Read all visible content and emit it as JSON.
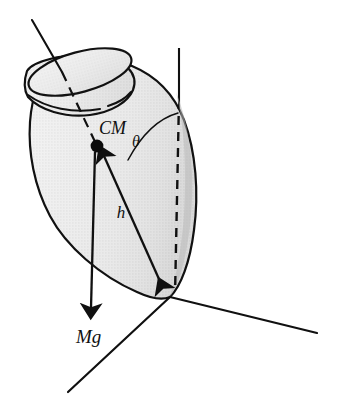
{
  "figure": {
    "name": "spinning-top-torque-diagram",
    "type": "physics-diagram",
    "background_color": "#ffffff",
    "width": 337,
    "height": 420
  },
  "labels": {
    "center_of_mass": "CM",
    "lever_arm": "h",
    "weight_force": "Mg",
    "tilt_angle": "θ"
  },
  "colors": {
    "ink": "#101010",
    "body_fill_light": "#ececec",
    "body_fill_mid": "#e2e2e2",
    "body_fill_shadow": "#c9c9c9",
    "rim_fill": "#e4e4e4",
    "outline": "#111111"
  },
  "elements": {
    "top_body": {
      "name": "spinning-top-body",
      "description": "Tear-drop / pear shaped top with a cylindrical neck, shaded with halftone gray"
    },
    "neck_rim": {
      "name": "top-neck-rim",
      "description": "Open elliptical rim at the top of the neck"
    },
    "neck_groove": {
      "name": "top-neck-groove",
      "description": "Curved groove line wrapping the neck below the rim"
    },
    "spin_axis": {
      "name": "spin-axis-line",
      "description": "Tilted symmetry axis of the top; solid outside the body, dashed inside down to CM"
    },
    "vertical_axis": {
      "name": "vertical-reference-axis",
      "description": "Vertical reference line through the pivot; solid above the body, dashed through it"
    },
    "cm_dot": {
      "name": "center-of-mass-dot",
      "description": "Filled black dot marking the center of mass"
    },
    "h_arrow": {
      "name": "lever-arm-arrow",
      "description": "Double-headed arrow from pivot to CM denoting distance h"
    },
    "mg_arrow": {
      "name": "weight-force-arrow",
      "description": "Downward arrow from CM representing the weight Mg"
    },
    "theta_arc": {
      "name": "tilt-angle-arc",
      "description": "Arc between the vertical axis and the lever arm marking angle theta"
    },
    "ground_axis_left": {
      "name": "ground-axis-left",
      "description": "Horizontal ground axis going down-left from the pivot"
    },
    "ground_axis_right": {
      "name": "ground-axis-right",
      "description": "Horizontal ground axis going down-right from the pivot"
    },
    "pivot_point": {
      "name": "pivot-point",
      "description": "Contact point of the top's tip with the ground; origin of the axes"
    }
  },
  "geometry": {
    "pivot": {
      "x": 170,
      "y": 297
    },
    "cm": {
      "x": 97,
      "y": 146
    },
    "spin_axis_start": {
      "x": 32,
      "y": 20
    },
    "vertical_axis_top": {
      "x": 179,
      "y": 48
    },
    "mg_arrow_tip": {
      "x": 90,
      "y": 312
    },
    "ground_left_end": {
      "x": 68,
      "y": 392
    },
    "ground_right_end": {
      "x": 317,
      "y": 333
    }
  }
}
